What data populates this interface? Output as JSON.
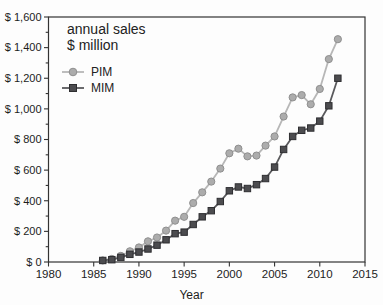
{
  "chart_data": {
    "type": "line",
    "title_lines": [
      "annual sales",
      "$ million"
    ],
    "xlabel": "Year",
    "ylabel": "",
    "xlim": [
      1980,
      2015
    ],
    "ylim": [
      0,
      1600
    ],
    "grid": false,
    "legend_position": "upper-left-inside",
    "x_tick_labels": [
      "1980",
      "1985",
      "1990",
      "1995",
      "2000",
      "2005",
      "2010",
      "2015"
    ],
    "y_tick_labels": [
      "$ 0",
      "$ 200",
      "$ 400",
      "$ 600",
      "$ 800",
      "$ 1,000",
      "$ 1,200",
      "$ 1,400",
      "$ 1,600"
    ],
    "y_major_step": 200,
    "y_minor_step": 100,
    "x": [
      1986,
      1987,
      1988,
      1989,
      1990,
      1991,
      1992,
      1993,
      1994,
      1995,
      1996,
      1997,
      1998,
      1999,
      2000,
      2001,
      2002,
      2003,
      2004,
      2005,
      2006,
      2007,
      2008,
      2009,
      2010,
      2011,
      2012
    ],
    "series": [
      {
        "name": "PIM",
        "marker": "circle",
        "line_color": "#b7b7b7",
        "marker_fill": "#acacac",
        "marker_edge": "#8f8f8f",
        "values": [
          10,
          20,
          40,
          70,
          95,
          135,
          160,
          205,
          270,
          295,
          385,
          455,
          525,
          610,
          710,
          740,
          690,
          695,
          760,
          820,
          950,
          1075,
          1090,
          1030,
          1130,
          1325,
          1455
        ]
      },
      {
        "name": "MIM",
        "marker": "square",
        "line_color": "#5a5a5d",
        "marker_fill": "#4c4c4f",
        "marker_edge": "#2e2e31",
        "values": [
          10,
          15,
          30,
          50,
          65,
          85,
          110,
          145,
          185,
          195,
          245,
          295,
          335,
          395,
          465,
          490,
          480,
          505,
          545,
          620,
          735,
          820,
          860,
          875,
          920,
          1020,
          1200
        ]
      }
    ],
    "frame_color": "#333333"
  }
}
